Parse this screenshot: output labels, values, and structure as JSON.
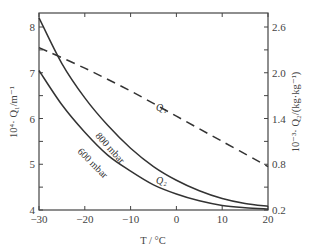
{
  "chart_data": {
    "type": "line",
    "title": "",
    "xlabel": "T / °C",
    "ylabel_left": "10^4 · Q1 / m^-1",
    "ylabel_right": "10^-3 · Q2 / (kg·kg^-1)",
    "xlim": [
      -30,
      20
    ],
    "ylim_left": [
      4,
      8.2
    ],
    "ylim_right": [
      0.2,
      2.7
    ],
    "x_ticks": [
      -30,
      -20,
      -10,
      0,
      10,
      20
    ],
    "y_left_ticks": [
      4,
      5,
      6,
      7,
      8
    ],
    "y_right_ticks": [
      0.2,
      0.8,
      1.4,
      2.0,
      2.6
    ],
    "grid": false,
    "legend": "inline labels",
    "series": [
      {
        "name": "Q1",
        "axis": "left",
        "style": "dashed",
        "x": [
          -30,
          -20,
          -10,
          0,
          10,
          20
        ],
        "values": [
          7.55,
          7.1,
          6.6,
          6.05,
          5.5,
          4.95
        ]
      },
      {
        "name": "Q2 (800 mbar)",
        "axis": "left",
        "style": "solid",
        "x": [
          -30,
          -25,
          -20,
          -15,
          -10,
          -5,
          0,
          5,
          10,
          15,
          20
        ],
        "values": [
          8.2,
          7.2,
          6.45,
          5.85,
          5.35,
          4.95,
          4.65,
          4.42,
          4.25,
          4.14,
          4.08
        ]
      },
      {
        "name": "Q2 (600 mbar)",
        "axis": "left",
        "style": "solid",
        "x": [
          -30,
          -25,
          -20,
          -15,
          -10,
          -5,
          0,
          5,
          10,
          15,
          20
        ],
        "values": [
          7.05,
          6.3,
          5.7,
          5.2,
          4.85,
          4.55,
          4.35,
          4.2,
          4.1,
          4.05,
          4.02
        ]
      }
    ],
    "annotations": [
      "Q1",
      "Q2",
      "800 mbar",
      "600 mbar"
    ]
  },
  "labels": {
    "x_axis": "T / °C",
    "y_left": "10⁴· Q₁/m⁻¹",
    "y_right": "10⁻³· Q₂/(kg·kg⁻¹)",
    "q1": "Q₁",
    "q2": "Q₂",
    "p800": "800 mbar",
    "p600": "600 mbar"
  }
}
